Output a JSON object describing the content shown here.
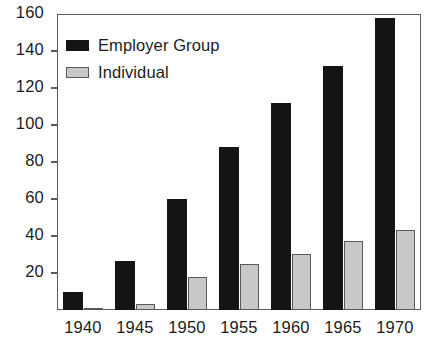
{
  "chart_data": {
    "type": "bar",
    "title": "",
    "subtitle": "",
    "xlabel": "",
    "ylabel": "",
    "categories": [
      "1940",
      "1945",
      "1950",
      "1955",
      "1960",
      "1965",
      "1970"
    ],
    "series": [
      {
        "name": "Employer Group",
        "color": "#151515",
        "values": [
          10,
          26.5,
          60,
          88,
          112,
          132,
          158
        ]
      },
      {
        "name": "Individual",
        "color": "#c8c8c8",
        "values": [
          1,
          3,
          18,
          25,
          30.5,
          37.5,
          43
        ]
      }
    ],
    "ylim": [
      0,
      160
    ],
    "yticks": [
      0,
      20,
      40,
      60,
      80,
      100,
      120,
      140,
      160
    ],
    "ytick_labels": [
      "",
      "20",
      "40",
      "60",
      "80",
      "100",
      "120",
      "140",
      "160"
    ],
    "grid": false,
    "legend_position": "top-left",
    "frame": true
  },
  "legend": {
    "entries": [
      {
        "label": "Employer Group",
        "swatch": "black-filled-swatch"
      },
      {
        "label": "Individual",
        "swatch": "gray-outlined-swatch"
      }
    ]
  },
  "colors": {
    "employer_group": "#151515",
    "individual_fill": "#c8c8c8",
    "individual_border": "#585858",
    "axis": "#5b5b5b",
    "text": "#1c1c1c",
    "background": "#ffffff"
  }
}
